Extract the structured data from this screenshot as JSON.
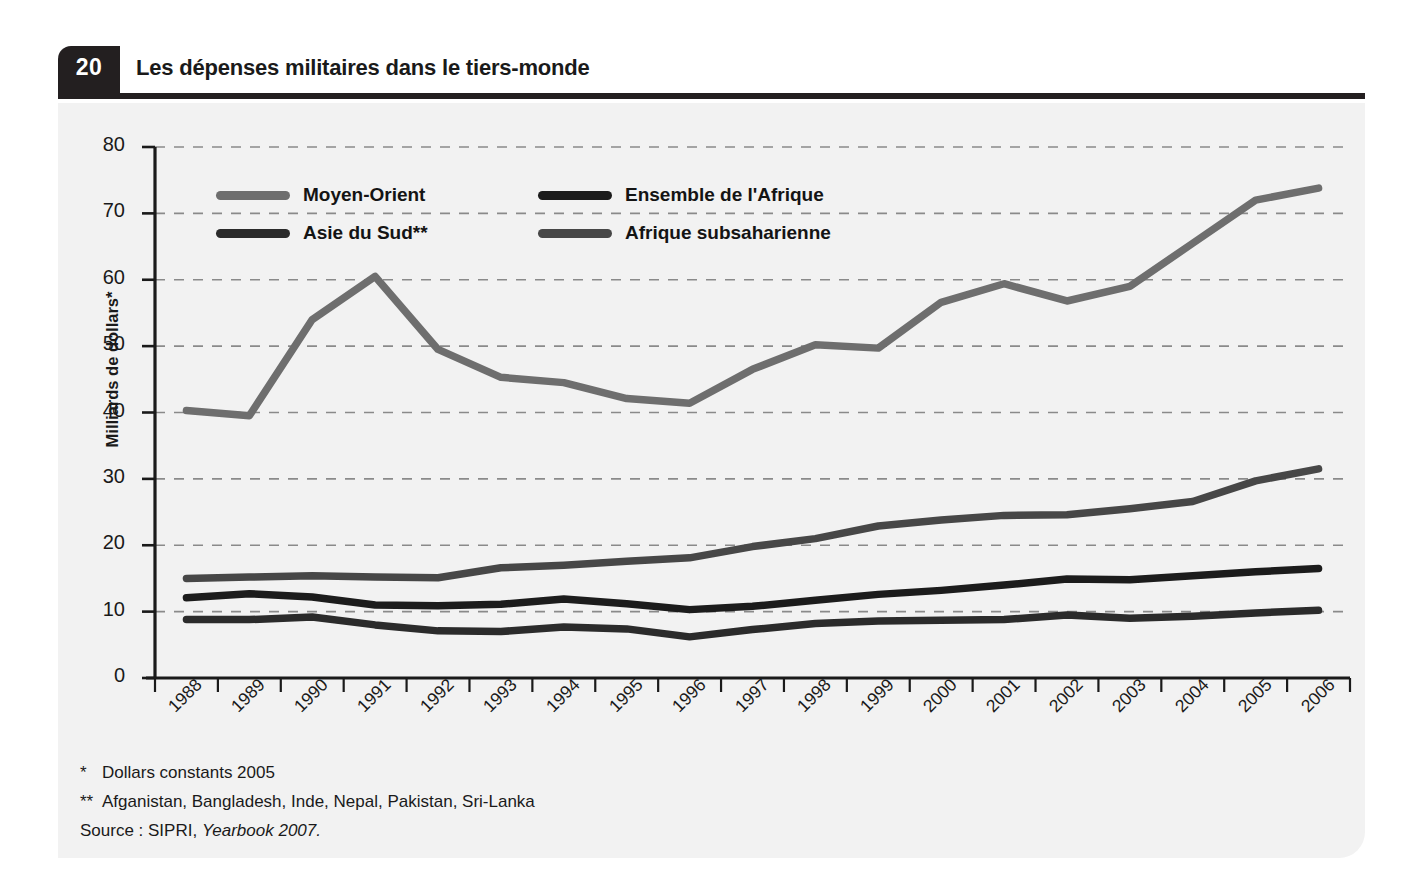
{
  "header": {
    "page_number": "20",
    "title": "Les dépenses militaires dans le tiers-monde"
  },
  "notes": [
    {
      "mark": "*",
      "text": "Dollars constants 2005"
    },
    {
      "mark": "**",
      "text": "Afganistan, Bangladesh, Inde, Nepal, Pakistan, Sri-Lanka"
    }
  ],
  "source": {
    "prefix": "Source : SIPRI, ",
    "italic": "Yearbook 2007."
  },
  "colors": {
    "moyen_orient": "#6e6e6e",
    "asie_du_sud": "#2b2b2b",
    "ensemble_afrique": "#1c1c1c",
    "afrique_subsaharienne": "#474747",
    "grid": "#8a8a8a",
    "axis": "#1a1a1a",
    "panel": "#f2f2f2",
    "badge": "#231f20"
  },
  "chart_data": {
    "type": "line",
    "title": "Les dépenses militaires dans le tiers-monde",
    "xlabel": "",
    "ylabel": "Milliards de dollars*",
    "ylim": [
      0,
      80
    ],
    "yticks": [
      0,
      10,
      20,
      30,
      40,
      50,
      60,
      70,
      80
    ],
    "grid": true,
    "legend_position": "upper-left-inside",
    "categories": [
      "1988",
      "1989",
      "1990",
      "1991",
      "1992",
      "1993",
      "1994",
      "1995",
      "1996",
      "1997",
      "1998",
      "1999",
      "2000",
      "2001",
      "2002",
      "2003",
      "2004",
      "2005",
      "2006"
    ],
    "series": [
      {
        "name": "Moyen-Orient",
        "color": "#6e6e6e",
        "values": [
          40.3,
          39.5,
          54.0,
          60.5,
          49.5,
          45.3,
          44.5,
          42.1,
          41.4,
          46.5,
          50.2,
          49.7,
          56.6,
          59.4,
          56.8,
          59.0,
          65.5,
          72.0,
          73.8
        ]
      },
      {
        "name": "Afrique subsaharienne",
        "color": "#474747",
        "values": [
          15.0,
          15.2,
          15.4,
          15.2,
          15.1,
          16.6,
          17.0,
          17.6,
          18.1,
          19.8,
          21.0,
          22.9,
          23.8,
          24.5,
          24.6,
          25.5,
          26.6,
          29.7,
          31.5
        ]
      },
      {
        "name": "Ensemble de l'Afrique",
        "color": "#1c1c1c",
        "values": [
          12.1,
          12.7,
          12.2,
          11.0,
          10.9,
          11.1,
          11.9,
          11.2,
          10.3,
          10.8,
          11.7,
          12.6,
          13.2,
          14.0,
          14.9,
          14.8,
          15.4,
          16.0,
          16.5
        ]
      },
      {
        "name": "Asie du Sud**",
        "color": "#2b2b2b",
        "values": [
          8.8,
          8.8,
          9.2,
          8.0,
          7.1,
          7.0,
          7.7,
          7.4,
          6.2,
          7.3,
          8.2,
          8.6,
          8.7,
          8.8,
          9.5,
          9.0,
          9.3,
          9.8,
          10.2
        ]
      }
    ],
    "legend_entries": [
      {
        "label": "Moyen-Orient",
        "color": "#6e6e6e"
      },
      {
        "label": "Ensemble de l'Afrique",
        "color": "#1c1c1c"
      },
      {
        "label": "Asie du Sud**",
        "color": "#2b2b2b"
      },
      {
        "label": "Afrique subsaharienne",
        "color": "#474747"
      }
    ]
  }
}
